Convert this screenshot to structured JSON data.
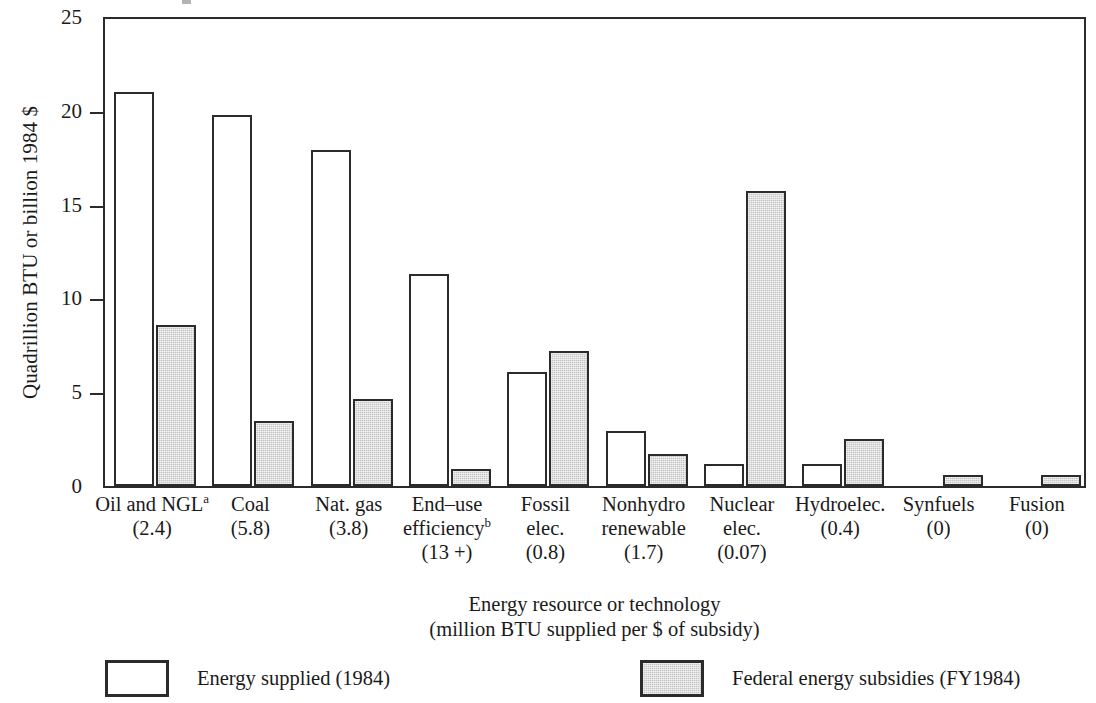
{
  "axes": {
    "ylabel": "Quadrillion BTU or billion 1984 $",
    "xtitle_line1": "Energy resource or technology",
    "xtitle_line2": "(million BTU supplied per $ of subsidy)",
    "yticks": [
      "0",
      "5",
      "10",
      "15",
      "20",
      "25"
    ]
  },
  "legend": {
    "items": [
      {
        "label": "Energy supplied (1984)",
        "swatch": "white-open-rectangle"
      },
      {
        "label": "Federal energy subsidies (FY1984)",
        "swatch": "gray-filled-rectangle"
      }
    ]
  },
  "colors": {
    "supplied_fill": "#ffffff",
    "subsidy_fill": "#c4c4c4",
    "outline": "#2b2b2b",
    "text": "#1a1a1a"
  },
  "chart_data": {
    "type": "bar",
    "title": "",
    "xlabel": "Energy resource or technology (million BTU supplied per $ of subsidy)",
    "ylabel": "Quadrillion BTU or billion 1984 $",
    "ylim": [
      0,
      25
    ],
    "yticks": [
      0,
      5,
      10,
      15,
      20,
      25
    ],
    "grid": false,
    "legend_position": "below-plot",
    "categories": [
      "Oil and NGLᵃ",
      "Coal",
      "Nat. gas",
      "End–use efficiencyᵇ",
      "Fossil elec.",
      "Nonhydro renewable",
      "Nuclear elec.",
      "Hydroelec.",
      "Synfuels",
      "Fusion"
    ],
    "category_labels": [
      {
        "lines": [
          "Oil and NGL",
          "(2.4)"
        ],
        "superscript": "a",
        "superscript_line": 0
      },
      {
        "lines": [
          "Coal",
          "(5.8)"
        ]
      },
      {
        "lines": [
          "Nat. gas",
          "(3.8)"
        ]
      },
      {
        "lines": [
          "End–use",
          "efficiency",
          "(13 +)"
        ],
        "superscript": "b",
        "superscript_line": 1
      },
      {
        "lines": [
          "Fossil",
          "elec.",
          "(0.8)"
        ]
      },
      {
        "lines": [
          "Nonhydro",
          "renewable",
          "(1.7)"
        ]
      },
      {
        "lines": [
          "Nuclear",
          "elec.",
          "(0.07)"
        ]
      },
      {
        "lines": [
          "Hydroelec.",
          "(0.4)"
        ]
      },
      {
        "lines": [
          "Synfuels",
          "(0)"
        ]
      },
      {
        "lines": [
          "Fusion",
          "(0)"
        ]
      }
    ],
    "subsidy_efficiency_values": [
      "2.4",
      "5.8",
      "3.8",
      "13 +",
      "0.8",
      "1.7",
      "0.07",
      "0.4",
      "0",
      "0"
    ],
    "series": [
      {
        "name": "Energy supplied (1984)",
        "fill": "#ffffff",
        "values": [
          21.0,
          19.8,
          17.9,
          11.3,
          6.1,
          2.95,
          1.15,
          1.15,
          0,
          0
        ]
      },
      {
        "name": "Federal energy subsidies (FY1984)",
        "fill": "#c4c4c4",
        "values": [
          8.6,
          3.45,
          4.65,
          0.9,
          7.2,
          1.7,
          15.75,
          2.5,
          0.6,
          0.6
        ]
      }
    ],
    "footnote_markers": [
      "a",
      "b"
    ]
  }
}
